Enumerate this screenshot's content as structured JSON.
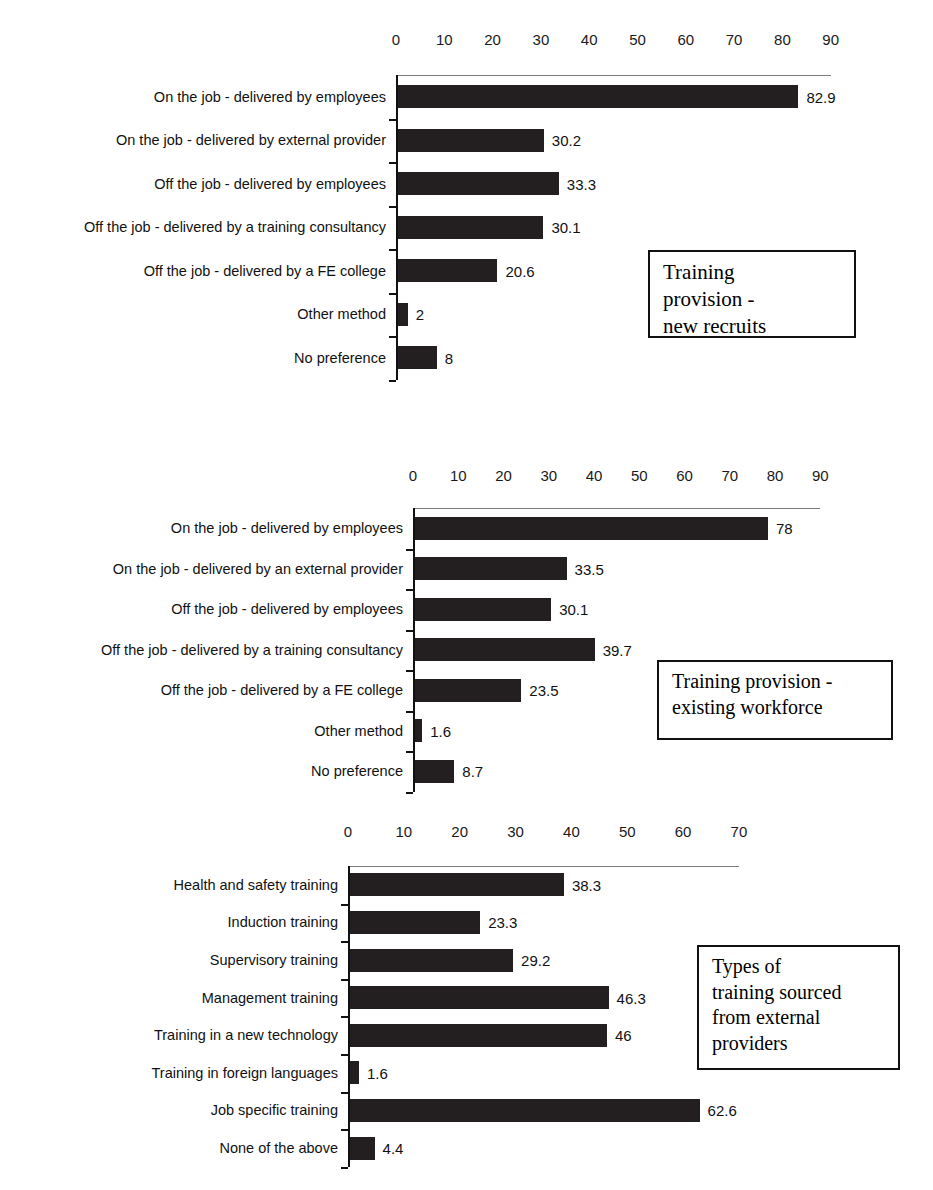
{
  "chart_data": [
    {
      "type": "bar",
      "orientation": "horizontal",
      "title": "Training provision - new recruits",
      "caption": "Training\nprovision -\nnew recruits",
      "xlabel": "",
      "ylabel": "",
      "xlim": [
        0,
        90
      ],
      "ticks": [
        0,
        10,
        20,
        30,
        40,
        50,
        60,
        70,
        80,
        90
      ],
      "tick_labels": [
        "0",
        "10",
        "20",
        "30",
        "40",
        "50",
        "60",
        "70",
        "80",
        "90"
      ],
      "grid": false,
      "categories": [
        "On the job - delivered by employees",
        "On the job - delivered by external provider",
        "Off the job - delivered by employees",
        "Off the job - delivered by a training consultancy",
        "Off the job - delivered by a FE college",
        "Other method",
        "No preference"
      ],
      "values": [
        82.9,
        30.2,
        33.3,
        30.1,
        20.6,
        2,
        8
      ],
      "value_labels": [
        "82.9",
        "30.2",
        "33.3",
        "30.1",
        "20.6",
        "2",
        "8"
      ]
    },
    {
      "type": "bar",
      "orientation": "horizontal",
      "title": "Training provision - existing workforce",
      "caption": "Training provision -\nexisting workforce",
      "xlabel": "",
      "ylabel": "",
      "xlim": [
        0,
        90
      ],
      "ticks": [
        0,
        10,
        20,
        30,
        40,
        50,
        60,
        70,
        80,
        90
      ],
      "tick_labels": [
        "0",
        "10",
        "20",
        "30",
        "40",
        "50",
        "60",
        "70",
        "80",
        "90"
      ],
      "grid": false,
      "categories": [
        "On the job - delivered by employees",
        "On the job - delivered by an external provider",
        "Off the job - delivered by employees",
        "Off the job - delivered by a training consultancy",
        "Off the job - delivered by a FE college",
        "Other method",
        "No preference"
      ],
      "values": [
        78,
        33.5,
        30.1,
        39.7,
        23.5,
        1.6,
        8.7
      ],
      "value_labels": [
        "78",
        "33.5",
        "30.1",
        "39.7",
        "23.5",
        "1.6",
        "8.7"
      ]
    },
    {
      "type": "bar",
      "orientation": "horizontal",
      "title": "Types of training sourced from external providers",
      "caption": "Types of\ntraining sourced\nfrom external\nproviders",
      "xlabel": "",
      "ylabel": "",
      "xlim": [
        0,
        70
      ],
      "ticks": [
        0,
        10,
        20,
        30,
        40,
        50,
        60,
        70
      ],
      "tick_labels": [
        "0",
        "10",
        "20",
        "30",
        "40",
        "50",
        "60",
        "70"
      ],
      "grid": false,
      "categories": [
        "Health and safety training",
        "Induction training",
        "Supervisory training",
        "Management training",
        "Training in a new technology",
        "Training in foreign languages",
        "Job specific training",
        "None of the above"
      ],
      "values": [
        38.3,
        23.3,
        29.2,
        46.3,
        46,
        1.6,
        62.6,
        4.4
      ],
      "value_labels": [
        "38.3",
        "23.3",
        "29.2",
        "46.3",
        "46",
        "1.6",
        "62.6",
        "4.4"
      ]
    }
  ],
  "colors": {
    "bar": "#231f20",
    "axis": "#111111",
    "text": "#111111",
    "background": "#ffffff"
  }
}
